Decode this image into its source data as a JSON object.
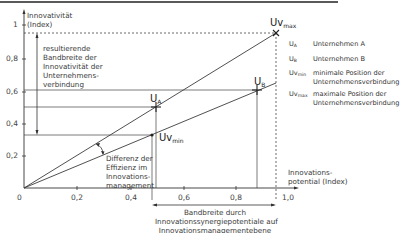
{
  "diagram": {
    "y_axis": {
      "label_line1": "Innovativität",
      "label_line2": "(Index)",
      "ticks": [
        "1",
        "0,8",
        "0,6",
        "0,4",
        "0,2"
      ]
    },
    "x_axis": {
      "label_line1": "Innovations-",
      "label_line2": "potential (Index)",
      "ticks": [
        "0",
        "0,2",
        "0,4",
        "0,6",
        "0,8",
        "1,0"
      ]
    },
    "points": {
      "ua": {
        "main": "U",
        "sub": "A",
        "x": 0.5,
        "y": 0.5
      },
      "ub": {
        "main": "U",
        "sub": "B",
        "x": 0.88,
        "y": 0.6
      },
      "uvmin": {
        "main": "Uv",
        "sub": "min",
        "x": 0.48,
        "y": 0.33
      },
      "uvmax": {
        "main": "Uv",
        "sub": "max",
        "x": 0.95,
        "y": 0.95
      }
    },
    "annotations": {
      "bandwidth_innovativity": [
        "resultierende",
        "Bandbreite der",
        "Innovativität der",
        "Unternehmens-",
        "verbindung"
      ],
      "efficiency_difference": [
        "Differenz der",
        "Effizienz im",
        "Innovations-",
        "management"
      ],
      "bandwidth_synergy": [
        "Bandbreite durch",
        "Innovationssynergiepotentiale auf",
        "Innovationsmanagementebene"
      ]
    },
    "legend": [
      {
        "key_main": "U",
        "key_sub": "A",
        "text": "Unternehmen A"
      },
      {
        "key_main": "U",
        "key_sub": "B",
        "text": "Unternehmen B"
      },
      {
        "key_main": "Uv",
        "key_sub": "min",
        "text": "minimale Position der\nUnternehmensverbindung"
      },
      {
        "key_main": "Uv",
        "key_sub": "max",
        "text": "maximale Position der\nUnternehmensverbindung"
      }
    ],
    "colors": {
      "line": "#3c3c3c",
      "text": "#333333"
    }
  }
}
